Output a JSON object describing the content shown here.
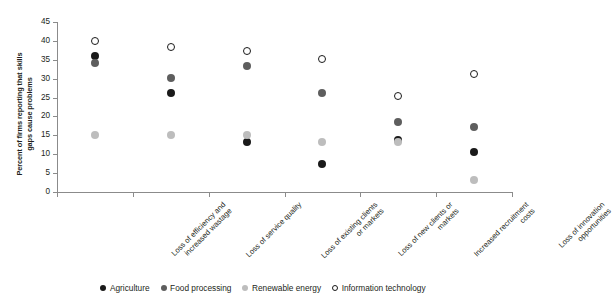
{
  "chart_data": {
    "type": "scatter",
    "title": "",
    "xlabel": "",
    "ylabel": "Percent of firms reporting that skills\ngaps cause problems",
    "ylim": [
      0,
      45
    ],
    "ytick_labels": [
      "0",
      "5",
      "10",
      "15",
      "20",
      "25",
      "30",
      "35",
      "40",
      "45"
    ],
    "ytick_values": [
      0,
      5,
      10,
      15,
      20,
      25,
      30,
      35,
      40,
      45
    ],
    "grid": false,
    "legend_position": "bottom",
    "categories": [
      "Loss of efficiency and\nincreased wastage",
      "Loss of service quality",
      "Loss of existing clients\nor markets",
      "Loss of new clients or\nmarkets",
      "Increased recruitment\ncosts",
      "Loss of innovation\nopportunities"
    ],
    "series": [
      {
        "name": "Agriculture",
        "key": "agriculture",
        "color": "#1a1a1a",
        "marker": "filled-circle",
        "values": [
          36.1,
          26.1,
          13.3,
          7.3,
          13.8,
          10.5
        ]
      },
      {
        "name": "Food processing",
        "key": "food",
        "color": "#5e5e5e",
        "marker": "filled-circle",
        "values": [
          34.1,
          30.2,
          33.3,
          26.3,
          18.5,
          17.3
        ]
      },
      {
        "name": "Renewable energy",
        "key": "renewable",
        "color": "#bdbdbd",
        "marker": "filled-circle",
        "values": [
          15.0,
          15.1,
          15.2,
          13.3,
          13.3,
          3.3
        ]
      },
      {
        "name": "Information technology",
        "key": "infotech",
        "color": "#ffffff",
        "marker": "open-circle",
        "values": [
          40.1,
          38.3,
          37.2,
          35.3,
          25.5,
          31.2
        ]
      }
    ]
  }
}
